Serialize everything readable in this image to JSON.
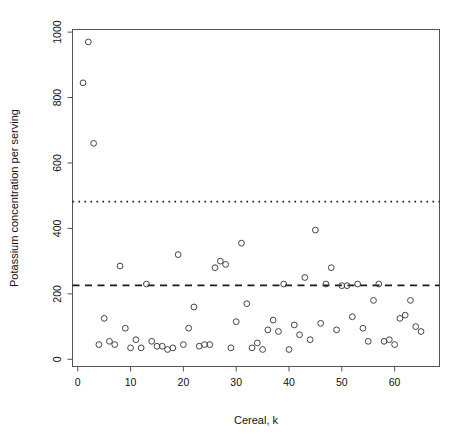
{
  "chart_data": {
    "type": "scatter",
    "title": "",
    "xlabel": "Cereal, k",
    "ylabel": "Potassium concentration per serving",
    "xlim": [
      -1.0,
      68.5
    ],
    "ylim": [
      -22,
      1008
    ],
    "xticks": [
      0,
      10,
      20,
      30,
      40,
      50,
      60
    ],
    "yticks": [
      0,
      200,
      400,
      600,
      800,
      1000
    ],
    "xtick_labels": [
      "0",
      "10",
      "20",
      "30",
      "40",
      "50",
      "60"
    ],
    "ytick_labels": [
      "0",
      "200",
      "400",
      "600",
      "800",
      "1000"
    ],
    "grid": false,
    "legend": null,
    "point_marker": "open-circle",
    "point_color": "#444444",
    "x": [
      1,
      2,
      3,
      4,
      5,
      6,
      7,
      8,
      9,
      10,
      11,
      12,
      13,
      14,
      15,
      16,
      17,
      18,
      19,
      20,
      21,
      22,
      23,
      24,
      25,
      26,
      27,
      28,
      29,
      30,
      31,
      32,
      33,
      34,
      35,
      36,
      37,
      38,
      39,
      40,
      41,
      42,
      43,
      44,
      45,
      46,
      47,
      48,
      49,
      50,
      51,
      52,
      53,
      54,
      55,
      56,
      57,
      58,
      59,
      60,
      61,
      62,
      63,
      64,
      65
    ],
    "y": [
      845,
      970,
      660,
      45,
      125,
      55,
      45,
      285,
      95,
      35,
      60,
      35,
      230,
      55,
      40,
      40,
      30,
      35,
      320,
      45,
      95,
      160,
      40,
      45,
      45,
      280,
      300,
      290,
      35,
      115,
      355,
      170,
      35,
      50,
      30,
      90,
      120,
      85,
      230,
      30,
      105,
      75,
      250,
      60,
      395,
      110,
      230,
      280,
      90,
      225,
      225,
      130,
      230,
      95,
      55,
      180,
      230,
      55,
      60,
      45,
      125,
      135,
      180,
      100,
      85
    ],
    "reference_lines": [
      {
        "name": "dotted-reference-line",
        "value": 482,
        "style": "dotted"
      },
      {
        "name": "dashed-reference-line",
        "value": 226,
        "style": "dashed"
      }
    ]
  }
}
